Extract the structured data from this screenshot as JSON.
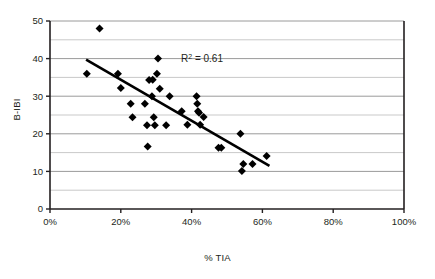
{
  "chart_data": {
    "type": "scatter",
    "title": "",
    "xlabel": "% TIA",
    "ylabel": "B-IBI",
    "xlim": [
      0,
      100
    ],
    "ylim": [
      0,
      50
    ],
    "x_ticks": [
      0,
      20,
      40,
      60,
      80,
      100
    ],
    "x_tick_labels": [
      "0%",
      "20%",
      "40%",
      "60%",
      "80%",
      "100%"
    ],
    "y_ticks": [
      0,
      10,
      20,
      30,
      40,
      50
    ],
    "y_tick_labels": [
      "0",
      "10",
      "20",
      "30",
      "40",
      "50"
    ],
    "y_minor_gridlines": [
      5,
      15,
      25,
      35,
      45
    ],
    "grid": true,
    "grid_color": "#9a9a9a",
    "minor_grid_color": "#c9c9c9",
    "legend": "none",
    "marker": "diamond",
    "marker_color": "#000000",
    "marker_size": 4,
    "annotations": [
      {
        "name": "r-squared-label",
        "text_prefix": "R",
        "text_superscript": "2",
        "text_suffix": " = 0.61",
        "text": "R2 = 0.61",
        "x": 37,
        "y": 39
      }
    ],
    "trendline": {
      "type": "linear",
      "color": "#000000",
      "width": 2.6,
      "x_start": 10.2,
      "y_start": 39.7,
      "x_end": 62.0,
      "y_end": 11.5,
      "r_squared": 0.61
    },
    "points": [
      {
        "x": 10.4,
        "y": 36.0
      },
      {
        "x": 14.0,
        "y": 48.0
      },
      {
        "x": 19.2,
        "y": 36.0
      },
      {
        "x": 20.0,
        "y": 32.2
      },
      {
        "x": 22.8,
        "y": 28.0
      },
      {
        "x": 23.3,
        "y": 24.4
      },
      {
        "x": 26.8,
        "y": 28.0
      },
      {
        "x": 27.4,
        "y": 22.3
      },
      {
        "x": 27.6,
        "y": 16.6
      },
      {
        "x": 28.0,
        "y": 34.3
      },
      {
        "x": 28.8,
        "y": 30.0
      },
      {
        "x": 29.0,
        "y": 34.4
      },
      {
        "x": 29.3,
        "y": 24.4
      },
      {
        "x": 29.6,
        "y": 22.3
      },
      {
        "x": 30.2,
        "y": 36.0
      },
      {
        "x": 30.5,
        "y": 40.0
      },
      {
        "x": 31.0,
        "y": 32.0
      },
      {
        "x": 32.8,
        "y": 22.3
      },
      {
        "x": 33.8,
        "y": 30.0
      },
      {
        "x": 37.2,
        "y": 26.0
      },
      {
        "x": 38.8,
        "y": 22.4
      },
      {
        "x": 41.4,
        "y": 30.0
      },
      {
        "x": 41.6,
        "y": 28.0
      },
      {
        "x": 41.8,
        "y": 26.0
      },
      {
        "x": 42.1,
        "y": 25.6
      },
      {
        "x": 42.4,
        "y": 22.4
      },
      {
        "x": 43.4,
        "y": 24.5
      },
      {
        "x": 47.6,
        "y": 16.3
      },
      {
        "x": 48.4,
        "y": 16.3
      },
      {
        "x": 53.8,
        "y": 20.0
      },
      {
        "x": 54.2,
        "y": 10.1
      },
      {
        "x": 54.6,
        "y": 12.0
      },
      {
        "x": 57.2,
        "y": 12.0
      },
      {
        "x": 61.2,
        "y": 14.1
      }
    ]
  },
  "layout": {
    "plot_left_px": 50,
    "plot_right_px": 404,
    "plot_top_px": 21,
    "plot_bottom_px": 209
  }
}
